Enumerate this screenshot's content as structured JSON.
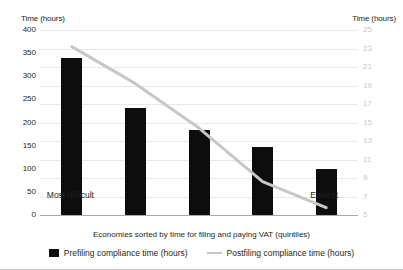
{
  "chart_data": {
    "type": "bar",
    "title": "",
    "categories": [
      "Most difficult",
      "2",
      "3",
      "4",
      "Easiest"
    ],
    "left_axis": {
      "label": "Time (hours)",
      "ticks": [
        400,
        350,
        300,
        250,
        200,
        150,
        100,
        50,
        0
      ],
      "ylim": [
        0,
        400
      ]
    },
    "right_axis": {
      "label": "Time (hours)",
      "ticks": [
        25,
        23,
        21,
        19,
        17,
        15,
        13,
        11,
        9,
        7,
        5
      ],
      "ylim": [
        5,
        25
      ]
    },
    "xlabel": "Economies sorted by time for filing and paying VAT (quintiles)",
    "grid": true,
    "legend_position": "bottom-center",
    "series": [
      {
        "name": "Prefiling compliance time (hours)",
        "type": "bar",
        "axis": "left",
        "color": "#0d0d0d",
        "values": [
          340,
          232,
          184,
          146,
          99
        ]
      },
      {
        "name": "Postfiling compliance time (hours)",
        "type": "line",
        "axis": "right",
        "color": "#c6c7c9",
        "values": [
          23.2,
          19.2,
          14.4,
          8.6,
          5.8
        ]
      }
    ],
    "x_endpoint_labels": {
      "left": "Most difficult",
      "right": "Easiest"
    }
  },
  "colors": {
    "bar": "#0d0d0d",
    "line": "#c6c7c9",
    "gridline": "#e9e9ea",
    "baseline": "#a9a9ac",
    "text": "#231f20",
    "right_tick_text": "#c6c7c9"
  }
}
